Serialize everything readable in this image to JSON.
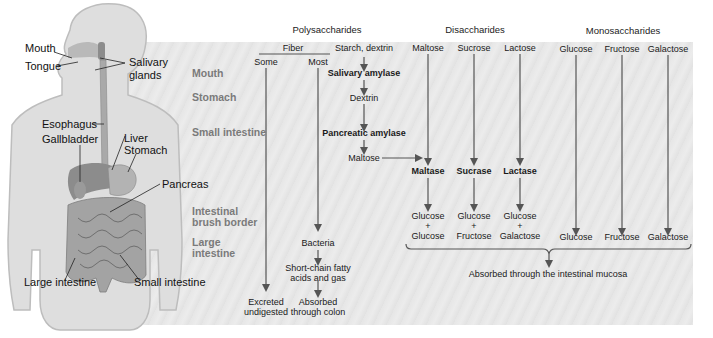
{
  "headers": {
    "polysaccharides": "Polysaccharides",
    "disaccharides": "Disaccharides",
    "monosaccharides": "Monosaccharides"
  },
  "organs": {
    "mouth": "Mouth",
    "tongue": "Tongue",
    "salivary_glands_1": "Salivary",
    "salivary_glands_2": "glands",
    "esophagus": "Esophagus",
    "gallbladder": "Gallbladder",
    "liver": "Liver",
    "stomach": "Stomach",
    "pancreas": "Pancreas",
    "large_intestine": "Large intestine",
    "small_intestine": "Small intestine"
  },
  "regions": {
    "mouth": "Mouth",
    "stomach": "Stomach",
    "small_intestine": "Small intestine",
    "brush_border_1": "Intestinal",
    "brush_border_2": "brush border",
    "large_intestine_1": "Large",
    "large_intestine_2": "intestine"
  },
  "fiber": {
    "label": "Fiber",
    "some": "Some",
    "most": "Most",
    "bacteria": "Bacteria",
    "scfa_1": "Short-chain fatty",
    "scfa_2": "acids and gas",
    "excreted_1": "Excreted",
    "excreted_2": "undigested",
    "absorbed_1": "Absorbed",
    "absorbed_2": "through colon"
  },
  "starch": {
    "label": "Starch, dextrin",
    "salivary_amylase": "Salivary amylase",
    "dextrin": "Dextrin",
    "pancreatic_amylase": "Pancreatic amylase",
    "maltose": "Maltose"
  },
  "disaccharides": [
    {
      "name": "Maltose",
      "enzyme": "Maltase",
      "product_a": "Glucose",
      "plus": "+",
      "product_b": "Glucose"
    },
    {
      "name": "Sucrose",
      "enzyme": "Sucrase",
      "product_a": "Glucose",
      "plus": "+",
      "product_b": "Fructose"
    },
    {
      "name": "Lactose",
      "enzyme": "Lactase",
      "product_a": "Glucose",
      "plus": "+",
      "product_b": "Galactose"
    }
  ],
  "monosaccharides": [
    {
      "name": "Glucose",
      "product": "Glucose"
    },
    {
      "name": "Fructose",
      "product": "Fructose"
    },
    {
      "name": "Galactose",
      "product": "Galactose"
    }
  ],
  "absorption": "Absorbed through the intestinal mucosa",
  "colors": {
    "panel": "#e6e6e6",
    "arrow": "#555555",
    "region_label": "#7a7a7a",
    "body": "#d9d9d9",
    "organ": "#8a8a8a"
  }
}
